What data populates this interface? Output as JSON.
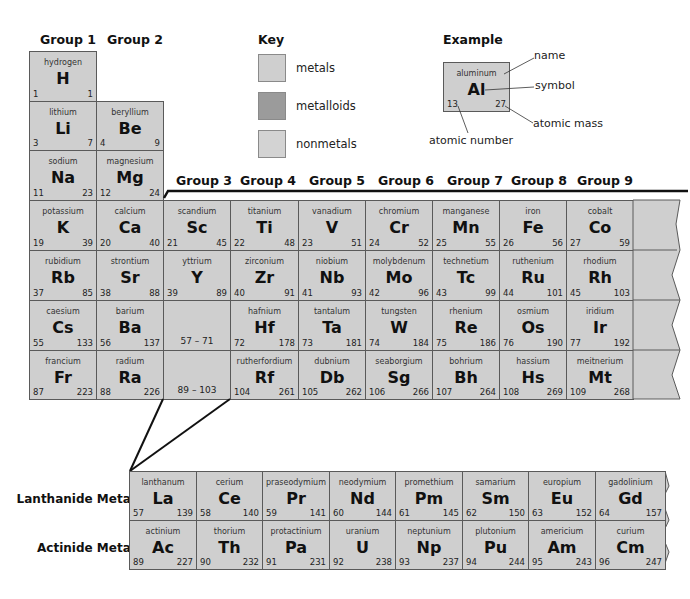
{
  "group_headers": [
    {
      "label": "Group 1",
      "x": 40,
      "y": 32
    },
    {
      "label": "Group 2",
      "x": 107,
      "y": 32
    },
    {
      "label": "Group 3",
      "x": 176,
      "y": 173
    },
    {
      "label": "Group 4",
      "x": 240,
      "y": 173
    },
    {
      "label": "Group 5",
      "x": 309,
      "y": 173
    },
    {
      "label": "Group 6",
      "x": 378,
      "y": 173
    },
    {
      "label": "Group 7",
      "x": 447,
      "y": 173
    },
    {
      "label": "Group 8",
      "x": 511,
      "y": 173
    },
    {
      "label": "Group 9",
      "x": 577,
      "y": 173
    }
  ],
  "key": {
    "title": "Key",
    "items": [
      {
        "label": "metals",
        "color": "#cfcfcf"
      },
      {
        "label": "metalloids",
        "color": "#9b9b9b"
      },
      {
        "label": "nonmetals",
        "color": "#d3d3d3"
      }
    ]
  },
  "example": {
    "title": "Example",
    "element": {
      "name": "aluminum",
      "symbol": "Al",
      "number": "13",
      "mass": "27"
    },
    "annotations": {
      "name": "name",
      "symbol": "symbol",
      "mass": "atomic mass",
      "number": "atomic number"
    }
  },
  "main_table": [
    {
      "row": 0,
      "col": 0,
      "name": "hydrogen",
      "symbol": "H",
      "number": "1",
      "mass": "1"
    },
    {
      "row": 1,
      "col": 0,
      "name": "lithium",
      "symbol": "Li",
      "number": "3",
      "mass": "7"
    },
    {
      "row": 1,
      "col": 1,
      "name": "beryllium",
      "symbol": "Be",
      "number": "4",
      "mass": "9"
    },
    {
      "row": 2,
      "col": 0,
      "name": "sodium",
      "symbol": "Na",
      "number": "11",
      "mass": "23"
    },
    {
      "row": 2,
      "col": 1,
      "name": "magnesium",
      "symbol": "Mg",
      "number": "12",
      "mass": "24"
    },
    {
      "row": 3,
      "col": 0,
      "name": "potassium",
      "symbol": "K",
      "number": "19",
      "mass": "39"
    },
    {
      "row": 3,
      "col": 1,
      "name": "calcium",
      "symbol": "Ca",
      "number": "20",
      "mass": "40"
    },
    {
      "row": 3,
      "col": 2,
      "name": "scandium",
      "symbol": "Sc",
      "number": "21",
      "mass": "45"
    },
    {
      "row": 3,
      "col": 3,
      "name": "titanium",
      "symbol": "Ti",
      "number": "22",
      "mass": "48"
    },
    {
      "row": 3,
      "col": 4,
      "name": "vanadium",
      "symbol": "V",
      "number": "23",
      "mass": "51"
    },
    {
      "row": 3,
      "col": 5,
      "name": "chromium",
      "symbol": "Cr",
      "number": "24",
      "mass": "52"
    },
    {
      "row": 3,
      "col": 6,
      "name": "manganese",
      "symbol": "Mn",
      "number": "25",
      "mass": "55"
    },
    {
      "row": 3,
      "col": 7,
      "name": "iron",
      "symbol": "Fe",
      "number": "26",
      "mass": "56"
    },
    {
      "row": 3,
      "col": 8,
      "name": "cobalt",
      "symbol": "Co",
      "number": "27",
      "mass": "59"
    },
    {
      "row": 4,
      "col": 0,
      "name": "rubidium",
      "symbol": "Rb",
      "number": "37",
      "mass": "85"
    },
    {
      "row": 4,
      "col": 1,
      "name": "strontium",
      "symbol": "Sr",
      "number": "38",
      "mass": "88"
    },
    {
      "row": 4,
      "col": 2,
      "name": "yttrium",
      "symbol": "Y",
      "number": "39",
      "mass": "89"
    },
    {
      "row": 4,
      "col": 3,
      "name": "zirconium",
      "symbol": "Zr",
      "number": "40",
      "mass": "91"
    },
    {
      "row": 4,
      "col": 4,
      "name": "niobium",
      "symbol": "Nb",
      "number": "41",
      "mass": "93"
    },
    {
      "row": 4,
      "col": 5,
      "name": "molybdenum",
      "symbol": "Mo",
      "number": "42",
      "mass": "96"
    },
    {
      "row": 4,
      "col": 6,
      "name": "technetium",
      "symbol": "Tc",
      "number": "43",
      "mass": "99"
    },
    {
      "row": 4,
      "col": 7,
      "name": "ruthenium",
      "symbol": "Ru",
      "number": "44",
      "mass": "101"
    },
    {
      "row": 4,
      "col": 8,
      "name": "rhodium",
      "symbol": "Rh",
      "number": "45",
      "mass": "103"
    },
    {
      "row": 5,
      "col": 0,
      "name": "caesium",
      "symbol": "Cs",
      "number": "55",
      "mass": "133"
    },
    {
      "row": 5,
      "col": 1,
      "name": "barium",
      "symbol": "Ba",
      "number": "56",
      "mass": "137"
    },
    {
      "row": 5,
      "col": 2,
      "range": "57 – 71"
    },
    {
      "row": 5,
      "col": 3,
      "name": "hafnium",
      "symbol": "Hf",
      "number": "72",
      "mass": "178"
    },
    {
      "row": 5,
      "col": 4,
      "name": "tantalum",
      "symbol": "Ta",
      "number": "73",
      "mass": "181"
    },
    {
      "row": 5,
      "col": 5,
      "name": "tungsten",
      "symbol": "W",
      "number": "74",
      "mass": "184"
    },
    {
      "row": 5,
      "col": 6,
      "name": "rhenium",
      "symbol": "Re",
      "number": "75",
      "mass": "186"
    },
    {
      "row": 5,
      "col": 7,
      "name": "osmium",
      "symbol": "Os",
      "number": "76",
      "mass": "190"
    },
    {
      "row": 5,
      "col": 8,
      "name": "iridium",
      "symbol": "Ir",
      "number": "77",
      "mass": "192"
    },
    {
      "row": 6,
      "col": 0,
      "name": "francium",
      "symbol": "Fr",
      "number": "87",
      "mass": "223"
    },
    {
      "row": 6,
      "col": 1,
      "name": "radium",
      "symbol": "Ra",
      "number": "88",
      "mass": "226"
    },
    {
      "row": 6,
      "col": 2,
      "range": "89 – 103"
    },
    {
      "row": 6,
      "col": 3,
      "name": "rutherfordium",
      "symbol": "Rf",
      "number": "104",
      "mass": "261"
    },
    {
      "row": 6,
      "col": 4,
      "name": "dubnium",
      "symbol": "Db",
      "number": "105",
      "mass": "262"
    },
    {
      "row": 6,
      "col": 5,
      "name": "seaborgium",
      "symbol": "Sg",
      "number": "106",
      "mass": "266"
    },
    {
      "row": 6,
      "col": 6,
      "name": "bohrium",
      "symbol": "Bh",
      "number": "107",
      "mass": "264"
    },
    {
      "row": 6,
      "col": 7,
      "name": "hassium",
      "symbol": "Hs",
      "number": "108",
      "mass": "269"
    },
    {
      "row": 6,
      "col": 8,
      "name": "meitnerium",
      "symbol": "Mt",
      "number": "109",
      "mass": "268"
    }
  ],
  "f_block": {
    "lanthanide_label": "Lanthanide Metals",
    "actinide_label": "Actinide Metals",
    "lanthanides": [
      {
        "name": "lanthanum",
        "symbol": "La",
        "number": "57",
        "mass": "139"
      },
      {
        "name": "cerium",
        "symbol": "Ce",
        "number": "58",
        "mass": "140"
      },
      {
        "name": "praseodymium",
        "symbol": "Pr",
        "number": "59",
        "mass": "141"
      },
      {
        "name": "neodymium",
        "symbol": "Nd",
        "number": "60",
        "mass": "144"
      },
      {
        "name": "promethium",
        "symbol": "Pm",
        "number": "61",
        "mass": "145"
      },
      {
        "name": "samarium",
        "symbol": "Sm",
        "number": "62",
        "mass": "150"
      },
      {
        "name": "europium",
        "symbol": "Eu",
        "number": "63",
        "mass": "152"
      },
      {
        "name": "gadolinium",
        "symbol": "Gd",
        "number": "64",
        "mass": "157"
      }
    ],
    "actinides": [
      {
        "name": "actinium",
        "symbol": "Ac",
        "number": "89",
        "mass": "227"
      },
      {
        "name": "thorium",
        "symbol": "Th",
        "number": "90",
        "mass": "232"
      },
      {
        "name": "protactinium",
        "symbol": "Pa",
        "number": "91",
        "mass": "231"
      },
      {
        "name": "uranium",
        "symbol": "U",
        "number": "92",
        "mass": "238"
      },
      {
        "name": "neptunium",
        "symbol": "Np",
        "number": "93",
        "mass": "237"
      },
      {
        "name": "plutonium",
        "symbol": "Pu",
        "number": "94",
        "mass": "244"
      },
      {
        "name": "americium",
        "symbol": "Am",
        "number": "95",
        "mass": "243"
      },
      {
        "name": "curium",
        "symbol": "Cm",
        "number": "96",
        "mass": "247"
      }
    ]
  },
  "colors": {
    "metal": "#cfcfcf",
    "metalloid": "#9b9b9b",
    "nonmetal": "#d3d3d3",
    "border": "#5a5a5a",
    "line": "#111111"
  }
}
